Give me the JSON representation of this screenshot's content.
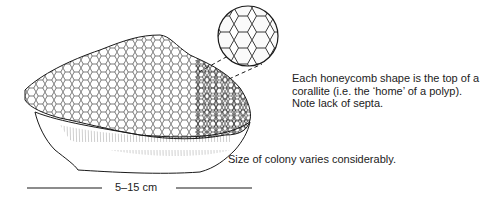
{
  "figure": {
    "annotations": {
      "corallite_note": "Each honeycomb shape is the top of a corallite (i.e. the ‘home’ of a polyp). Note lack of septa.",
      "size_note": "Size of colony varies considerably."
    },
    "scale_bar": {
      "label": "5–15 cm"
    },
    "colors": {
      "ink": "#1a1a1a",
      "background": "#ffffff"
    }
  }
}
